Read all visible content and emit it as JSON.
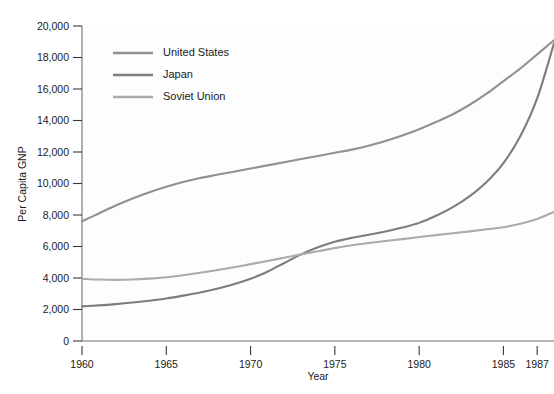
{
  "chart_data": {
    "type": "line",
    "title": "",
    "xlabel": "Year",
    "ylabel": "Per Capita GNP",
    "xlim": [
      1960,
      1988
    ],
    "ylim": [
      0,
      20000
    ],
    "grid": false,
    "legend_position": "top-left inside plot",
    "x_tick_labels": [
      "1960",
      "1965",
      "1970",
      "1975",
      "1980",
      "1985",
      "1987"
    ],
    "x_tick_values": [
      1960,
      1965,
      1970,
      1975,
      1980,
      1985,
      1987
    ],
    "y_tick_labels": [
      "0",
      "2,000",
      "4,000",
      "6,000",
      "8,000",
      "10,000",
      "12,000",
      "14,000",
      "16,000",
      "18,000",
      "20,000"
    ],
    "y_tick_values": [
      0,
      2000,
      4000,
      6000,
      8000,
      10000,
      12000,
      14000,
      16000,
      18000,
      20000
    ],
    "series": [
      {
        "name": "United States",
        "color": "#919191",
        "x": [
          1960,
          1961,
          1962,
          1963,
          1964,
          1965,
          1966,
          1967,
          1968,
          1969,
          1970,
          1971,
          1972,
          1973,
          1974,
          1975,
          1976,
          1977,
          1978,
          1979,
          1980,
          1981,
          1982,
          1983,
          1984,
          1985,
          1986,
          1987,
          1988
        ],
        "y": [
          7600,
          8100,
          8600,
          9050,
          9450,
          9800,
          10100,
          10350,
          10550,
          10750,
          10950,
          11150,
          11350,
          11550,
          11750,
          11950,
          12150,
          12400,
          12700,
          13050,
          13450,
          13900,
          14400,
          15000,
          15700,
          16500,
          17300,
          18200,
          19100
        ]
      },
      {
        "name": "Japan",
        "color": "#7d7d7d",
        "x": [
          1960,
          1961,
          1962,
          1963,
          1964,
          1965,
          1966,
          1967,
          1968,
          1969,
          1970,
          1971,
          1972,
          1973,
          1974,
          1975,
          1976,
          1977,
          1978,
          1979,
          1980,
          1981,
          1982,
          1983,
          1984,
          1985,
          1986,
          1987,
          1988
        ],
        "y": [
          2200,
          2260,
          2340,
          2440,
          2560,
          2700,
          2880,
          3080,
          3320,
          3600,
          3950,
          4400,
          4950,
          5500,
          5950,
          6300,
          6550,
          6750,
          6950,
          7200,
          7500,
          7950,
          8500,
          9200,
          10100,
          11300,
          13000,
          15400,
          18900
        ]
      },
      {
        "name": "Soviet Union",
        "color": "#ababab",
        "x": [
          1960,
          1961,
          1962,
          1963,
          1964,
          1965,
          1966,
          1967,
          1968,
          1969,
          1970,
          1971,
          1972,
          1973,
          1974,
          1975,
          1976,
          1977,
          1978,
          1979,
          1980,
          1981,
          1982,
          1983,
          1984,
          1985,
          1986,
          1987,
          1988
        ],
        "y": [
          3950,
          3900,
          3880,
          3900,
          3960,
          4050,
          4180,
          4330,
          4500,
          4680,
          4880,
          5080,
          5290,
          5500,
          5700,
          5900,
          6080,
          6220,
          6350,
          6470,
          6600,
          6720,
          6840,
          6960,
          7090,
          7220,
          7450,
          7750,
          8200
        ]
      }
    ],
    "annotations": []
  },
  "legend": {
    "items": [
      {
        "label": "United States",
        "color": "#919191"
      },
      {
        "label": "Japan",
        "color": "#7d7d7d"
      },
      {
        "label": "Soviet Union",
        "color": "#ababab"
      }
    ]
  },
  "axes": {
    "y_axis_title": "Per Capita GNP",
    "x_axis_title": "Year"
  },
  "artifact": {
    "top_strip_text": ""
  }
}
